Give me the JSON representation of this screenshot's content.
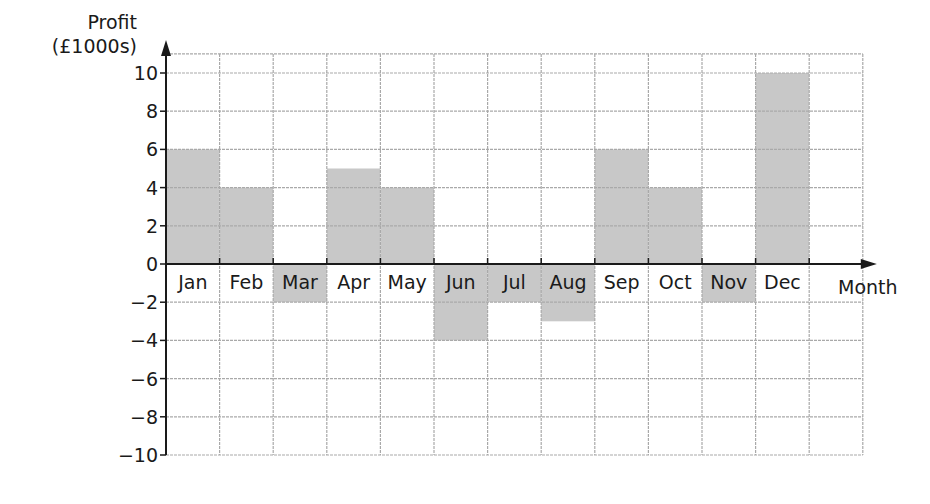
{
  "chart_data": {
    "type": "bar",
    "title": "",
    "ylabel": "Profit (£1000s)",
    "ylabel_lines": [
      "Profit",
      "(£1000s)"
    ],
    "xlabel": "Month",
    "categories": [
      "Jan",
      "Feb",
      "Mar",
      "Apr",
      "May",
      "Jun",
      "Jul",
      "Aug",
      "Sep",
      "Oct",
      "Nov",
      "Dec"
    ],
    "values": [
      6,
      4,
      -2,
      5,
      4,
      -4,
      -2,
      -3,
      6,
      4,
      -2,
      10
    ],
    "ylim": [
      -10,
      11
    ],
    "yticks": [
      -10,
      -8,
      -6,
      -4,
      -2,
      0,
      2,
      4,
      6,
      8,
      10
    ],
    "ytick_labels": [
      "−10",
      "−8",
      "−6",
      "−4",
      "−2",
      "0",
      "2",
      "4",
      "6",
      "8",
      "10"
    ],
    "grid": true,
    "legend": null,
    "bar_width": "full category width (no gaps)",
    "negative_bars_shade_label_cell": true
  },
  "colors": {
    "bar": "#c8c8c8",
    "grid": "#a9a9a9",
    "axis": "#1a1a1a",
    "background": "#ffffff"
  }
}
